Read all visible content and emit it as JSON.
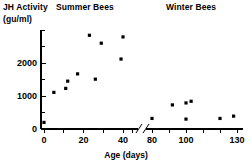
{
  "figure": {
    "yaxis_label_line1": "JH Activity",
    "yaxis_label_line2": "(gu/ml)",
    "title_left": "Summer Bees",
    "title_right": "Winter Bees",
    "xaxis_label": "Age (days)"
  },
  "chart_data": {
    "type": "scatter",
    "title": "",
    "xlabel": "Age (days)",
    "ylabel": "JH Activity (gu/ml)",
    "group_labels": [
      "Summer Bees",
      "Winter Bees"
    ],
    "xlim_left_segment": [
      0,
      45
    ],
    "xlim_right_segment": [
      75,
      130
    ],
    "axis_break": true,
    "axis_break_position": 45,
    "ylim": [
      0,
      3000
    ],
    "grid": false,
    "legend": "none",
    "marker": "filled-square",
    "marker_color": "#000000",
    "y_ticks_major": [
      0,
      1000,
      2000
    ],
    "y_tick_labels": [
      "0",
      "1000",
      "2000"
    ],
    "y_ticks_minor": [
      500,
      1500,
      2500,
      3000
    ],
    "x_ticks_left": [
      0,
      10,
      20,
      30,
      40
    ],
    "x_tick_labels_left": [
      "0",
      "",
      "20",
      "",
      "40"
    ],
    "x_ticks_right": [
      80,
      90,
      100,
      110,
      120,
      130
    ],
    "x_tick_labels_right": [
      "80",
      "",
      "100",
      "",
      "",
      "130"
    ],
    "series": [
      {
        "name": "Summer Bees",
        "points": [
          {
            "x": 0,
            "y": 200
          },
          {
            "x": 5,
            "y": 1110
          },
          {
            "x": 11,
            "y": 1230
          },
          {
            "x": 12,
            "y": 1450
          },
          {
            "x": 17,
            "y": 1670
          },
          {
            "x": 23,
            "y": 2840
          },
          {
            "x": 26,
            "y": 1510
          },
          {
            "x": 29,
            "y": 2600
          },
          {
            "x": 39,
            "y": 2120
          },
          {
            "x": 40,
            "y": 2790
          }
        ]
      },
      {
        "name": "Winter Bees",
        "points": [
          {
            "x": 80,
            "y": 320
          },
          {
            "x": 92,
            "y": 730
          },
          {
            "x": 100,
            "y": 300
          },
          {
            "x": 100,
            "y": 790
          },
          {
            "x": 103,
            "y": 840
          },
          {
            "x": 120,
            "y": 320
          },
          {
            "x": 128,
            "y": 390
          }
        ]
      }
    ]
  }
}
